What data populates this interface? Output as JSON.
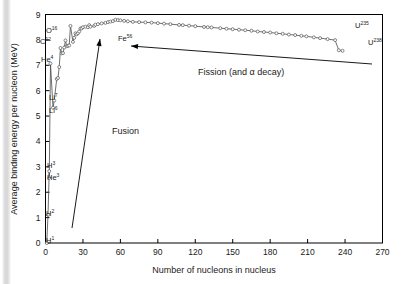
{
  "chart_data": {
    "type": "line",
    "title": "",
    "xlabel": "Number of nucleons in nucleus",
    "ylabel": "Average binding energy per nucleon (MeV)",
    "xlim": [
      0,
      270
    ],
    "ylim": [
      0,
      9
    ],
    "xticks": [
      "0",
      "30",
      "60",
      "90",
      "120",
      "150",
      "180",
      "210",
      "240",
      "270"
    ],
    "xtick_values": [
      0,
      30,
      60,
      90,
      120,
      150,
      180,
      210,
      240,
      270
    ],
    "yticks": [
      "0",
      "1",
      "2",
      "3",
      "4",
      "5",
      "6",
      "7",
      "8",
      "9"
    ],
    "ytick_values": [
      0,
      1,
      2,
      3,
      4,
      5,
      6,
      7,
      8,
      9
    ],
    "grid": false,
    "legend": "none",
    "marker": "open-circle",
    "series": [
      {
        "name": "Binding energy per nucleon",
        "x": [
          1,
          2,
          3,
          3,
          4,
          6,
          7,
          9,
          10,
          11,
          12,
          13,
          14,
          15,
          16,
          17,
          18,
          19,
          20,
          22,
          23,
          24,
          25,
          26,
          27,
          28,
          29,
          30,
          32,
          34,
          35,
          36,
          39,
          40,
          42,
          45,
          48,
          50,
          52,
          54,
          56,
          58,
          60,
          63,
          66,
          70,
          75,
          80,
          85,
          90,
          95,
          100,
          107,
          110,
          115,
          120,
          127,
          130,
          133,
          140,
          145,
          150,
          155,
          160,
          165,
          170,
          175,
          180,
          185,
          190,
          195,
          200,
          205,
          209,
          215,
          220,
          226,
          232,
          235,
          238
        ],
        "y": [
          0.0,
          1.11,
          2.83,
          2.57,
          7.07,
          5.33,
          5.61,
          6.46,
          6.5,
          6.93,
          7.68,
          7.47,
          7.48,
          7.7,
          7.98,
          7.75,
          7.77,
          7.78,
          8.55,
          7.92,
          8.08,
          8.26,
          8.22,
          8.26,
          8.33,
          8.45,
          8.45,
          8.5,
          8.52,
          8.5,
          8.58,
          8.52,
          8.55,
          8.6,
          8.62,
          8.65,
          8.67,
          8.7,
          8.72,
          8.74,
          8.79,
          8.78,
          8.77,
          8.75,
          8.73,
          8.71,
          8.7,
          8.69,
          8.68,
          8.66,
          8.64,
          8.62,
          8.59,
          8.58,
          8.56,
          8.54,
          8.51,
          8.5,
          8.49,
          8.46,
          8.44,
          8.42,
          8.4,
          8.38,
          8.36,
          8.33,
          8.31,
          8.29,
          8.26,
          8.24,
          8.21,
          8.19,
          8.16,
          8.14,
          8.1,
          8.07,
          8.03,
          7.99,
          7.59,
          7.57
        ]
      }
    ],
    "point_labels": [
      {
        "element": "H",
        "mass": "1",
        "label": "H¹",
        "x": 1,
        "y": 0.0,
        "tx": 46,
        "ty": 243
      },
      {
        "element": "H",
        "mass": "2",
        "label": "H²",
        "x": 2,
        "y": 1.11,
        "tx": 46,
        "ty": 216
      },
      {
        "element": "He",
        "mass": "3",
        "label": "He³",
        "x": 3,
        "y": 2.57,
        "tx": 47,
        "ty": 180
      },
      {
        "element": "H",
        "mass": "3",
        "label": "H³",
        "x": 3,
        "y": 2.83,
        "tx": 47,
        "ty": 168
      },
      {
        "element": "Li",
        "mass": "6",
        "label": "Li⁶",
        "x": 6,
        "y": 5.33,
        "tx": 49,
        "ty": 113
      },
      {
        "element": "Li",
        "mass": "7",
        "label": "Li⁷",
        "x": 7,
        "y": 5.61,
        "tx": 49,
        "ty": 100
      },
      {
        "element": "He",
        "mass": "4",
        "label": "He⁴",
        "x": 4,
        "y": 7.07,
        "tx": 41,
        "ty": 62
      },
      {
        "element": "C",
        "mass": "12",
        "label": "C¹²",
        "x": 12,
        "y": 7.68,
        "tx": 40,
        "ty": 44
      },
      {
        "element": "O",
        "mass": "16",
        "label": "O¹⁶",
        "x": 16,
        "y": 7.98,
        "tx": 46,
        "ty": 33
      },
      {
        "element": "Fe",
        "mass": "56",
        "label": "Fe⁵⁶",
        "x": 56,
        "y": 8.79,
        "tx": 118,
        "ty": 41
      },
      {
        "element": "U",
        "mass": "235",
        "label": "U²³⁵",
        "x": 235,
        "y": 7.59,
        "tx": 355,
        "ty": 28
      },
      {
        "element": "U",
        "mass": "238",
        "label": "U²³⁸",
        "x": 238,
        "y": 7.57,
        "tx": 368,
        "ty": 45
      }
    ],
    "annotations": [
      {
        "name": "fusion",
        "text": "Fusion",
        "tx": 112,
        "ty": 134,
        "arrow": {
          "x1": 72,
          "y1": 228,
          "x2": 100,
          "y2": 39
        }
      },
      {
        "name": "fission",
        "text": "Fission (and α decay)",
        "tx": 198,
        "ty": 75,
        "arrow": {
          "x1": 372,
          "y1": 64,
          "x2": 131,
          "y2": 46
        }
      }
    ]
  },
  "frame": {
    "stroke_color": "#000000",
    "marker_color": "#555555"
  }
}
